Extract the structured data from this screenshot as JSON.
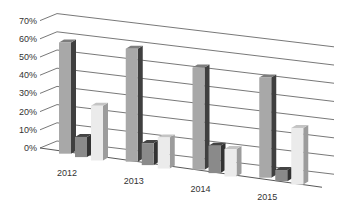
{
  "chart_data": {
    "type": "bar",
    "style": "3d-clustered-column",
    "title": "",
    "xlabel": "",
    "ylabel": "",
    "categories": [
      "2012",
      "2013",
      "2014",
      "2015"
    ],
    "series": [
      {
        "name": "Series 1",
        "color": "#a9a9a9",
        "values": [
          60,
          61,
          55,
          54
        ]
      },
      {
        "name": "Series 2",
        "color": "#7a7a7a",
        "values": [
          10,
          11,
          14,
          5
        ]
      },
      {
        "name": "Series 3",
        "color": "#e6e6e6",
        "values": [
          29,
          16,
          14,
          30
        ]
      }
    ],
    "y_ticks": [
      "0%",
      "10%",
      "20%",
      "30%",
      "40%",
      "50%",
      "60%",
      "70%"
    ],
    "ylim": [
      0,
      70
    ],
    "y_format": "percent",
    "grid": true,
    "legend": "none"
  }
}
